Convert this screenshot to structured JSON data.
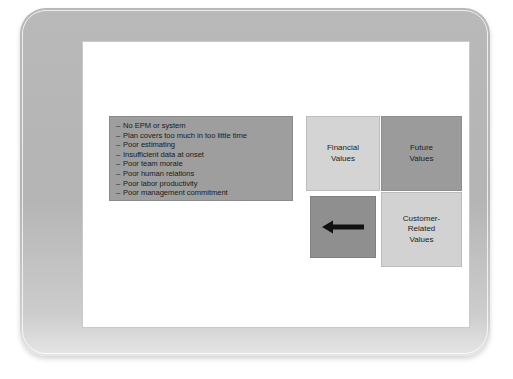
{
  "slide": {
    "issues_box": {
      "bullet_prefix": "–",
      "items": [
        "No EPM or system",
        "Plan covers too much in too little time",
        "Poor estimating",
        "Insufficient data at onset",
        "Poor team morale",
        "Poor human relations",
        "Poor labor productivity",
        "Poor management commitment"
      ]
    },
    "quadrants": [
      {
        "id": "financial",
        "label": "Financial\nValues",
        "fill": "#d4d4d4"
      },
      {
        "id": "future",
        "label": "Future\nValues",
        "fill": "#9b9b9b"
      },
      {
        "id": "arrow",
        "label": "",
        "fill": "#8f8f8f",
        "icon": "left-arrow-icon"
      },
      {
        "id": "customer",
        "label": "Customer-\nRelated\nValues",
        "fill": "#d2d2d2"
      }
    ],
    "colors": {
      "frame": "#b6b6b6",
      "canvas": "#ffffff",
      "issues_box": "#9e9e9e",
      "arrow": "#111111",
      "text": "#1c1c1c"
    }
  }
}
